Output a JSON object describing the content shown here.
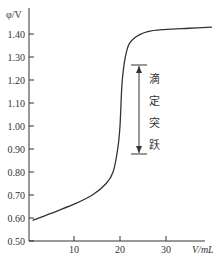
{
  "chart_data": {
    "type": "line",
    "title": "",
    "xlabel": "V/mL",
    "ylabel": "φ/V",
    "xlim": [
      0,
      40
    ],
    "ylim": [
      0.5,
      1.45
    ],
    "x_ticks": [
      "10",
      "20",
      "30"
    ],
    "y_ticks": [
      "0.50",
      "0.60",
      "0.70",
      "0.80",
      "0.90",
      "1.00",
      "1.10",
      "1.20",
      "1.30",
      "1.40"
    ],
    "grid": false,
    "legend": "none",
    "series": [
      {
        "name": "titration curve",
        "x": [
          1,
          5,
          10,
          14,
          17,
          18.5,
          19.5,
          20,
          20.5,
          21.5,
          23,
          26,
          30,
          35,
          40
        ],
        "y": [
          0.59,
          0.62,
          0.66,
          0.7,
          0.75,
          0.8,
          0.9,
          1.0,
          1.2,
          1.33,
          1.38,
          1.41,
          1.42,
          1.425,
          1.43
        ]
      }
    ],
    "annotations": [
      {
        "text": "滴定突跃",
        "type": "double-arrow",
        "y_from": 0.89,
        "y_to": 1.27,
        "x": 24.5
      }
    ]
  },
  "labels": {
    "ylabel": "φ/V",
    "xlabel": "V/mL",
    "annotation_chars": [
      "滴",
      "定",
      "突",
      "跃"
    ]
  }
}
